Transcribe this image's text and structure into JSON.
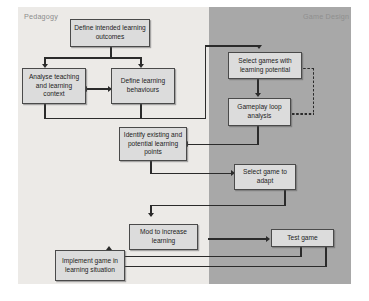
{
  "diagram": {
    "panels": [
      {
        "id": "pedagogy",
        "label": "Pedagogy",
        "color": "#eceae7"
      },
      {
        "id": "game_design",
        "label": "Game Design",
        "color": "#a8a8a8"
      }
    ],
    "node_fill": "#dcdcdc",
    "node_border": "#4a4a4a",
    "connector_color": "#2b2b2b",
    "nodes": [
      {
        "id": "define_outcomes",
        "label": "Define intended learning outcomes",
        "panel": "pedagogy"
      },
      {
        "id": "analyse_context",
        "label": "Analyse teaching and learning context",
        "panel": "pedagogy"
      },
      {
        "id": "define_behaviours",
        "label": "Define learning behaviours",
        "panel": "pedagogy"
      },
      {
        "id": "select_games",
        "label": "Select games with learning potential",
        "panel": "game_design"
      },
      {
        "id": "gameplay_loop",
        "label": "Gameplay loop analysis",
        "panel": "game_design"
      },
      {
        "id": "identify_points",
        "label": "Identify existing and potential learning points",
        "panel": "pedagogy"
      },
      {
        "id": "select_adapt",
        "label": "Select game to adapt",
        "panel": "game_design"
      },
      {
        "id": "mod_increase",
        "label": "Mod to increase learning",
        "panel": "pedagogy"
      },
      {
        "id": "test_game",
        "label": "Test game",
        "panel": "game_design"
      },
      {
        "id": "implement_game",
        "label": "Implement game in learning situation",
        "panel": "pedagogy"
      }
    ],
    "edges": [
      {
        "from": "define_outcomes",
        "to": "analyse_context",
        "style": "solid",
        "arrow": "single"
      },
      {
        "from": "define_outcomes",
        "to": "define_behaviours",
        "style": "solid",
        "arrow": "single"
      },
      {
        "from": "analyse_context",
        "to": "define_behaviours",
        "style": "solid",
        "arrow": "double"
      },
      {
        "from": "define_behaviours",
        "to": "select_games",
        "style": "solid",
        "arrow": "single"
      },
      {
        "from": "select_games",
        "to": "gameplay_loop",
        "style": "solid",
        "arrow": "single"
      },
      {
        "from": "gameplay_loop",
        "to": "select_games",
        "style": "dotted",
        "arrow": "single"
      },
      {
        "from": "gameplay_loop",
        "to": "identify_points",
        "style": "solid",
        "arrow": "single"
      },
      {
        "from": "identify_points",
        "to": "select_adapt",
        "style": "solid",
        "arrow": "single"
      },
      {
        "from": "select_adapt",
        "to": "mod_increase",
        "style": "solid",
        "arrow": "single"
      },
      {
        "from": "mod_increase",
        "to": "test_game",
        "style": "solid",
        "arrow": "single"
      },
      {
        "from": "test_game",
        "to": "mod_increase",
        "style": "solid",
        "arrow": "single"
      },
      {
        "from": "test_game",
        "to": "implement_game",
        "style": "solid",
        "arrow": "single"
      }
    ]
  }
}
